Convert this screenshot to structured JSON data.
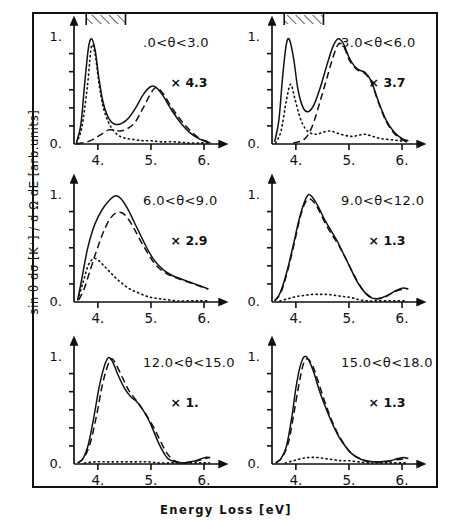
{
  "axes": {
    "ylabel": "sin θ dσ [K⁺] / d Ω dE [arb.units]",
    "xlabel": "Energy Loss [eV]",
    "y_ticks": [
      "0.",
      "1."
    ],
    "x_ticks": [
      "4.",
      "5.",
      "6."
    ],
    "xlim": [
      3.55,
      6.15
    ],
    "ylim": [
      0.0,
      1.06
    ],
    "y_minor_ticks": 5,
    "grid": false
  },
  "legend": {
    "solid": "total",
    "dashed": "component-dashed",
    "dotted": "component-dotted",
    "position": "none"
  },
  "panels": [
    {
      "id": "p1",
      "theta_label": ".0<θ<3.0",
      "scale_label": "× 4.3",
      "hatch_bar": true,
      "hatch_x": [
        3.78,
        4.52
      ]
    },
    {
      "id": "p2",
      "theta_label": "3.0<θ<6.0",
      "scale_label": "× 3.7",
      "hatch_bar": true,
      "hatch_x": [
        3.78,
        4.52
      ]
    },
    {
      "id": "p3",
      "theta_label": "6.0<θ<9.0",
      "scale_label": "× 2.9",
      "hatch_bar": false
    },
    {
      "id": "p4",
      "theta_label": "9.0<θ<12.0",
      "scale_label": "× 1.3",
      "hatch_bar": false
    },
    {
      "id": "p5",
      "theta_label": "12.0<θ<15.0",
      "scale_label": "× 1.",
      "hatch_bar": false
    },
    {
      "id": "p6",
      "theta_label": "15.0<θ<18.0",
      "scale_label": "× 1.3",
      "hatch_bar": false
    }
  ],
  "chart_data": {
    "type": "line",
    "title": "",
    "xlabel": "Energy Loss [eV]",
    "ylabel": "sin θ dσ [K⁺] / d Ω dE [arb.units]",
    "xlim": [
      3.55,
      6.15
    ],
    "ylim": [
      0.0,
      1.06
    ],
    "x_ticks": [
      4.0,
      5.0,
      6.0
    ],
    "y_ticks": [
      0.0,
      1.0
    ],
    "grid": false,
    "legend_position": "none",
    "panels": [
      {
        "name": ".0<θ<3.0",
        "scale": 4.3,
        "hatch_bar_range": [
          3.78,
          4.52
        ],
        "series": [
          {
            "name": "solid",
            "style": "solid",
            "x": [
              3.6,
              3.68,
              3.75,
              3.82,
              3.88,
              3.95,
              4.02,
              4.1,
              4.18,
              4.26,
              4.34,
              4.45,
              4.58,
              4.72,
              4.86,
              5.0,
              5.1,
              5.22,
              5.38,
              5.55,
              5.72,
              5.9,
              6.05,
              6.12
            ],
            "y": [
              0.02,
              0.18,
              0.55,
              0.88,
              0.97,
              0.86,
              0.6,
              0.38,
              0.26,
              0.2,
              0.18,
              0.19,
              0.24,
              0.34,
              0.46,
              0.53,
              0.52,
              0.45,
              0.32,
              0.2,
              0.11,
              0.05,
              0.02,
              0.01
            ]
          },
          {
            "name": "dashed",
            "style": "dashed",
            "x": [
              3.6,
              3.7,
              3.8,
              3.9,
              4.0,
              4.1,
              4.2,
              4.3,
              4.42,
              4.55,
              4.7,
              4.85,
              5.0,
              5.1,
              5.22,
              5.4,
              5.58,
              5.75,
              5.92,
              6.08
            ],
            "y": [
              0.0,
              0.01,
              0.02,
              0.04,
              0.07,
              0.1,
              0.13,
              0.13,
              0.12,
              0.14,
              0.2,
              0.33,
              0.47,
              0.52,
              0.47,
              0.33,
              0.21,
              0.12,
              0.05,
              0.02
            ]
          },
          {
            "name": "dotted",
            "style": "dotted",
            "x": [
              3.6,
              3.7,
              3.8,
              3.88,
              3.95,
              4.02,
              4.1,
              4.2,
              4.3,
              4.42,
              4.55,
              4.7,
              4.85,
              5.0,
              5.2,
              5.45,
              5.7,
              5.95,
              6.1
            ],
            "y": [
              0.01,
              0.16,
              0.52,
              0.9,
              0.82,
              0.56,
              0.34,
              0.2,
              0.12,
              0.07,
              0.05,
              0.04,
              0.03,
              0.03,
              0.02,
              0.02,
              0.01,
              0.01,
              0.01
            ]
          }
        ]
      },
      {
        "name": "3.0<θ<6.0",
        "scale": 3.7,
        "hatch_bar_range": [
          3.78,
          4.52
        ],
        "series": [
          {
            "name": "solid",
            "style": "solid",
            "x": [
              3.6,
              3.68,
              3.75,
              3.82,
              3.88,
              3.96,
              4.04,
              4.14,
              4.24,
              4.34,
              4.46,
              4.58,
              4.7,
              4.8,
              4.9,
              5.0,
              5.1,
              5.2,
              5.3,
              5.42,
              5.55,
              5.7,
              5.85,
              6.0,
              6.12
            ],
            "y": [
              0.02,
              0.22,
              0.62,
              0.92,
              0.96,
              0.78,
              0.5,
              0.33,
              0.3,
              0.36,
              0.52,
              0.72,
              0.9,
              0.97,
              0.92,
              0.8,
              0.72,
              0.68,
              0.66,
              0.58,
              0.4,
              0.22,
              0.11,
              0.05,
              0.03
            ]
          },
          {
            "name": "dashed",
            "style": "dashed",
            "x": [
              3.95,
              4.05,
              4.15,
              4.25,
              4.35,
              4.46,
              4.58,
              4.7,
              4.8,
              4.9,
              5.0,
              5.1,
              5.2,
              5.3,
              5.42,
              5.55,
              5.7,
              5.85,
              6.0,
              6.1
            ],
            "y": [
              0.01,
              0.02,
              0.04,
              0.1,
              0.22,
              0.4,
              0.6,
              0.8,
              0.92,
              0.9,
              0.78,
              0.71,
              0.67,
              0.65,
              0.57,
              0.39,
              0.21,
              0.1,
              0.04,
              0.02
            ]
          },
          {
            "name": "dotted",
            "style": "dotted",
            "x": [
              3.62,
              3.72,
              3.82,
              3.9,
              3.98,
              4.08,
              4.18,
              4.28,
              4.4,
              4.52,
              4.65,
              4.78,
              4.92,
              5.05,
              5.18,
              5.3,
              5.45,
              5.6,
              5.78,
              5.95,
              6.1
            ],
            "y": [
              0.01,
              0.12,
              0.4,
              0.55,
              0.42,
              0.24,
              0.14,
              0.1,
              0.09,
              0.11,
              0.12,
              0.1,
              0.08,
              0.07,
              0.08,
              0.09,
              0.07,
              0.05,
              0.04,
              0.03,
              0.02
            ]
          }
        ]
      },
      {
        "name": "6.0<θ<9.0",
        "scale": 2.9,
        "series": [
          {
            "name": "solid",
            "style": "solid",
            "x": [
              3.62,
              3.7,
              3.8,
              3.9,
              4.0,
              4.12,
              4.24,
              4.34,
              4.44,
              4.56,
              4.68,
              4.8,
              4.92,
              5.04,
              5.16,
              5.28,
              5.42,
              5.58,
              5.75,
              5.92,
              6.08
            ],
            "y": [
              0.02,
              0.22,
              0.48,
              0.66,
              0.78,
              0.88,
              0.95,
              0.98,
              0.95,
              0.86,
              0.74,
              0.62,
              0.5,
              0.4,
              0.33,
              0.28,
              0.24,
              0.21,
              0.18,
              0.15,
              0.12
            ]
          },
          {
            "name": "dashed",
            "style": "dashed",
            "x": [
              3.64,
              3.74,
              3.86,
              3.98,
              4.1,
              4.22,
              4.34,
              4.46,
              4.58,
              4.7,
              4.82,
              4.94,
              5.06,
              5.18,
              5.3,
              5.44,
              5.6,
              5.78,
              5.95,
              6.08
            ],
            "y": [
              0.02,
              0.12,
              0.3,
              0.48,
              0.64,
              0.76,
              0.82,
              0.82,
              0.76,
              0.66,
              0.55,
              0.45,
              0.36,
              0.3,
              0.26,
              0.23,
              0.2,
              0.17,
              0.14,
              0.12
            ]
          },
          {
            "name": "dotted",
            "style": "dotted",
            "x": [
              3.62,
              3.72,
              3.82,
              3.92,
              4.02,
              4.12,
              4.22,
              4.34,
              4.46,
              4.6,
              4.74,
              4.88,
              5.02,
              5.16,
              5.32,
              5.5,
              5.7,
              5.9,
              6.08
            ],
            "y": [
              0.02,
              0.18,
              0.34,
              0.4,
              0.38,
              0.33,
              0.28,
              0.22,
              0.17,
              0.12,
              0.09,
              0.06,
              0.04,
              0.03,
              0.02,
              0.01,
              0.01,
              0.01,
              0.01
            ]
          }
        ]
      },
      {
        "name": "9.0<θ<12.0",
        "scale": 1.3,
        "series": [
          {
            "name": "solid",
            "style": "solid",
            "x": [
              3.6,
              3.7,
              3.82,
              3.94,
              4.06,
              4.16,
              4.24,
              4.32,
              4.42,
              4.54,
              4.66,
              4.78,
              4.9,
              5.02,
              5.14,
              5.26,
              5.38,
              5.5,
              5.62,
              5.76,
              5.9,
              6.02,
              6.12
            ],
            "y": [
              0.01,
              0.08,
              0.26,
              0.5,
              0.76,
              0.92,
              0.99,
              0.96,
              0.88,
              0.76,
              0.66,
              0.56,
              0.44,
              0.32,
              0.2,
              0.11,
              0.05,
              0.03,
              0.04,
              0.07,
              0.11,
              0.13,
              0.12
            ]
          },
          {
            "name": "dashed",
            "style": "dashed",
            "x": [
              3.6,
              3.72,
              3.84,
              3.96,
              4.08,
              4.18,
              4.26,
              4.34,
              4.44,
              4.56,
              4.68,
              4.8,
              4.92,
              5.04,
              5.16,
              5.28,
              5.4,
              5.52,
              5.66,
              5.8,
              5.95,
              6.08
            ],
            "y": [
              0.01,
              0.09,
              0.28,
              0.52,
              0.78,
              0.92,
              0.95,
              0.92,
              0.84,
              0.72,
              0.62,
              0.53,
              0.42,
              0.3,
              0.19,
              0.1,
              0.05,
              0.03,
              0.04,
              0.08,
              0.11,
              0.12
            ]
          },
          {
            "name": "dotted",
            "style": "dotted",
            "x": [
              3.7,
              3.85,
              4.0,
              4.15,
              4.3,
              4.45,
              4.6,
              4.75,
              4.9,
              5.05,
              5.2,
              5.35,
              5.5,
              5.7,
              5.9,
              6.08
            ],
            "y": [
              0.01,
              0.03,
              0.05,
              0.06,
              0.07,
              0.07,
              0.07,
              0.06,
              0.05,
              0.04,
              0.02,
              0.01,
              0.01,
              0.01,
              0.01,
              0.01
            ]
          }
        ]
      },
      {
        "name": "12.0<θ<15.0",
        "scale": 1.0,
        "series": [
          {
            "name": "solid",
            "style": "solid",
            "x": [
              3.62,
              3.72,
              3.82,
              3.92,
              4.02,
              4.12,
              4.2,
              4.28,
              4.38,
              4.5,
              4.62,
              4.72,
              4.82,
              4.92,
              5.02,
              5.12,
              5.22,
              5.32,
              5.45,
              5.6,
              5.75,
              5.9,
              6.02,
              6.12
            ],
            "y": [
              0.01,
              0.05,
              0.18,
              0.42,
              0.7,
              0.9,
              0.98,
              0.94,
              0.82,
              0.7,
              0.62,
              0.58,
              0.52,
              0.44,
              0.34,
              0.22,
              0.12,
              0.05,
              0.02,
              0.01,
              0.02,
              0.04,
              0.06,
              0.06
            ]
          },
          {
            "name": "dashed",
            "style": "dashed",
            "x": [
              3.62,
              3.74,
              3.86,
              3.98,
              4.08,
              4.18,
              4.26,
              4.34,
              4.46,
              4.58,
              4.7,
              4.82,
              4.94,
              5.06,
              5.18,
              5.3,
              5.44,
              5.6,
              5.78,
              5.95,
              6.1
            ],
            "y": [
              0.01,
              0.06,
              0.2,
              0.46,
              0.72,
              0.9,
              0.97,
              0.92,
              0.8,
              0.68,
              0.6,
              0.52,
              0.43,
              0.33,
              0.21,
              0.1,
              0.03,
              0.01,
              0.02,
              0.04,
              0.06
            ]
          },
          {
            "name": "dotted",
            "style": "dotted",
            "x": [
              3.75,
              3.95,
              4.15,
              4.35,
              4.55,
              4.75,
              4.95,
              5.15,
              5.35,
              5.55,
              5.75,
              5.95,
              6.1
            ],
            "y": [
              0.01,
              0.02,
              0.02,
              0.02,
              0.02,
              0.02,
              0.02,
              0.01,
              0.01,
              0.01,
              0.01,
              0.01,
              0.01
            ]
          }
        ]
      },
      {
        "name": "15.0<θ<18.0",
        "scale": 1.3,
        "series": [
          {
            "name": "solid",
            "style": "solid",
            "x": [
              3.62,
              3.72,
              3.82,
              3.92,
              4.0,
              4.08,
              4.16,
              4.24,
              4.34,
              4.44,
              4.56,
              4.68,
              4.8,
              4.92,
              5.04,
              5.16,
              5.3,
              5.45,
              5.6,
              5.78,
              5.92,
              6.02,
              6.12
            ],
            "y": [
              0.01,
              0.05,
              0.16,
              0.42,
              0.7,
              0.9,
              0.99,
              0.96,
              0.84,
              0.68,
              0.52,
              0.38,
              0.26,
              0.17,
              0.1,
              0.06,
              0.03,
              0.02,
              0.02,
              0.03,
              0.05,
              0.06,
              0.05
            ]
          },
          {
            "name": "dashed",
            "style": "dashed",
            "x": [
              3.62,
              3.74,
              3.86,
              3.96,
              4.06,
              4.14,
              4.22,
              4.32,
              4.42,
              4.54,
              4.66,
              4.78,
              4.9,
              5.02,
              5.16,
              5.32,
              5.5,
              5.7,
              5.9,
              6.08
            ],
            "y": [
              0.01,
              0.06,
              0.2,
              0.46,
              0.74,
              0.92,
              0.97,
              0.9,
              0.76,
              0.58,
              0.42,
              0.29,
              0.19,
              0.11,
              0.06,
              0.03,
              0.02,
              0.02,
              0.04,
              0.05
            ]
          },
          {
            "name": "dotted",
            "style": "dotted",
            "x": [
              3.8,
              3.95,
              4.1,
              4.25,
              4.4,
              4.55,
              4.7,
              4.85,
              5.0,
              5.18,
              5.38,
              5.58,
              5.8,
              6.0,
              6.12
            ],
            "y": [
              0.01,
              0.03,
              0.05,
              0.06,
              0.06,
              0.05,
              0.04,
              0.03,
              0.03,
              0.02,
              0.01,
              0.01,
              0.01,
              0.01,
              0.01
            ]
          }
        ]
      }
    ]
  }
}
